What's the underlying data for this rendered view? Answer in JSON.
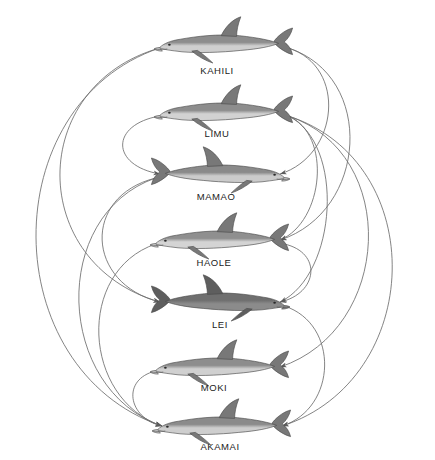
{
  "figure": {
    "type": "dominance-hierarchy-network",
    "background_color": "#ffffff",
    "width": 435,
    "height": 460,
    "arc_color": "#6e6e6e",
    "label_color": "#222222"
  },
  "nodes": [
    {
      "id": "kahili",
      "label": "KAHILI",
      "rank": 1,
      "x": 224,
      "y": 42,
      "length": 140,
      "facing": "left",
      "shade": "light",
      "body_top_color": "#8d8d8d",
      "body_belly_color": "#cfcfcf",
      "label_x": 217,
      "label_y": 70
    },
    {
      "id": "limu",
      "label": "LIMU",
      "rank": 2,
      "x": 224,
      "y": 110,
      "length": 140,
      "facing": "left",
      "shade": "light",
      "body_top_color": "#8d8d8d",
      "body_belly_color": "#d2d2d2",
      "label_x": 217,
      "label_y": 133
    },
    {
      "id": "mamao",
      "label": "MAMAO",
      "rank": 3,
      "x": 220,
      "y": 172,
      "length": 140,
      "facing": "right",
      "shade": "light",
      "body_top_color": "#8a8a8a",
      "body_belly_color": "#cbcbcb",
      "label_x": 216,
      "label_y": 196
    },
    {
      "id": "haole",
      "label": "HAOLE",
      "rank": 4,
      "x": 220,
      "y": 238,
      "length": 140,
      "facing": "left",
      "shade": "light",
      "body_top_color": "#8f8f8f",
      "body_belly_color": "#d4d4d4",
      "label_x": 214,
      "label_y": 262
    },
    {
      "id": "lei",
      "label": "LEI",
      "rank": 5,
      "x": 220,
      "y": 300,
      "length": 140,
      "facing": "right",
      "shade": "dark",
      "body_top_color": "#6f6f6f",
      "body_belly_color": "#8b8b8b",
      "label_x": 220,
      "label_y": 324
    },
    {
      "id": "moki",
      "label": "MOKI",
      "rank": 6,
      "x": 220,
      "y": 365,
      "length": 140,
      "facing": "left",
      "shade": "light",
      "body_top_color": "#8d8d8d",
      "body_belly_color": "#d0d0d0",
      "label_x": 214,
      "label_y": 387
    },
    {
      "id": "akamai",
      "label": "AKAMAI",
      "rank": 7,
      "x": 222,
      "y": 424,
      "length": 140,
      "facing": "left",
      "shade": "light",
      "body_top_color": "#8b8b8b",
      "body_belly_color": "#cecece",
      "label_x": 220,
      "label_y": 446
    }
  ],
  "edges": [
    {
      "from": "kahili",
      "to": "mamao",
      "side": "right",
      "bulge": 62
    },
    {
      "from": "kahili",
      "to": "haole",
      "side": "right",
      "bulge": 92
    },
    {
      "from": "kahili",
      "to": "lei",
      "side": "left",
      "bulge": 140
    },
    {
      "from": "kahili",
      "to": "akamai",
      "side": "left",
      "bulge": 175
    },
    {
      "from": "limu",
      "to": "mamao",
      "side": "left",
      "bulge": 52
    },
    {
      "from": "limu",
      "to": "haole",
      "side": "right",
      "bulge": 46
    },
    {
      "from": "limu",
      "to": "lei",
      "side": "right",
      "bulge": 60
    },
    {
      "from": "limu",
      "to": "moki",
      "side": "right",
      "bulge": 118
    },
    {
      "from": "limu",
      "to": "akamai",
      "side": "right",
      "bulge": 150
    },
    {
      "from": "mamao",
      "to": "lei",
      "side": "left",
      "bulge": 78
    },
    {
      "from": "mamao",
      "to": "akamai",
      "side": "left",
      "bulge": 112
    },
    {
      "from": "haole",
      "to": "lei",
      "side": "right",
      "bulge": 40
    },
    {
      "from": "haole",
      "to": "akamai",
      "side": "left",
      "bulge": 84
    },
    {
      "from": "lei",
      "to": "akamai",
      "side": "right",
      "bulge": 58
    },
    {
      "from": "moki",
      "to": "akamai",
      "side": "left",
      "bulge": 36
    }
  ]
}
